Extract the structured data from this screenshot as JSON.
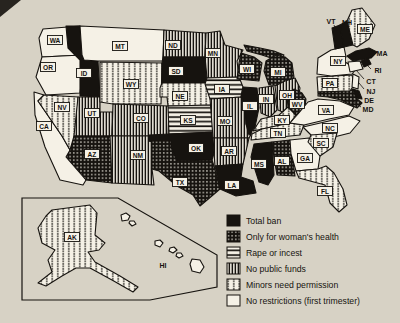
{
  "colors": {
    "page_bg": "#d7d2c5",
    "paper": "#f5f1e6",
    "ink": "#16130f"
  },
  "legend": {
    "items": [
      {
        "key": "ban",
        "label": "Total ban"
      },
      {
        "key": "health",
        "label": "Only for woman's health"
      },
      {
        "key": "rape",
        "label": "Rape or incest"
      },
      {
        "key": "funds",
        "label": "No public funds"
      },
      {
        "key": "minors",
        "label": "Minors need permission"
      },
      {
        "key": "none",
        "label": "No restrictions (first trimester)"
      }
    ]
  },
  "map": {
    "states": [
      {
        "abbr": "CA",
        "category": "none"
      },
      {
        "abbr": "WA",
        "category": "none"
      },
      {
        "abbr": "OR",
        "category": "none"
      },
      {
        "abbr": "NV",
        "category": "minors"
      },
      {
        "abbr": "ID",
        "category": "ban"
      },
      {
        "abbr": "UT",
        "category": "funds"
      },
      {
        "abbr": "AZ",
        "category": "health"
      },
      {
        "abbr": "MT",
        "category": "none"
      },
      {
        "abbr": "WY",
        "category": "minors"
      },
      {
        "abbr": "CO",
        "category": "funds"
      },
      {
        "abbr": "NM",
        "category": "funds"
      },
      {
        "abbr": "ND",
        "category": "funds"
      },
      {
        "abbr": "SD",
        "category": "ban"
      },
      {
        "abbr": "NE",
        "category": "minors"
      },
      {
        "abbr": "KS",
        "category": "rape"
      },
      {
        "abbr": "OK",
        "category": "ban"
      },
      {
        "abbr": "TX",
        "category": "health"
      },
      {
        "abbr": "MN",
        "category": "funds"
      },
      {
        "abbr": "IA",
        "category": "rape"
      },
      {
        "abbr": "MO",
        "category": "funds"
      },
      {
        "abbr": "AR",
        "category": "funds"
      },
      {
        "abbr": "LA",
        "category": "ban"
      },
      {
        "abbr": "WI",
        "category": "health"
      },
      {
        "abbr": "IL",
        "category": "ban"
      },
      {
        "abbr": "MS",
        "category": "ban"
      },
      {
        "abbr": "MI",
        "category": "health"
      },
      {
        "abbr": "IN",
        "category": "funds"
      },
      {
        "abbr": "OH",
        "category": "funds"
      },
      {
        "abbr": "KY",
        "category": "minors"
      },
      {
        "abbr": "TN",
        "category": "minors"
      },
      {
        "abbr": "AL",
        "category": "health"
      },
      {
        "abbr": "GA",
        "category": "none"
      },
      {
        "abbr": "FL",
        "category": "minors"
      },
      {
        "abbr": "WV",
        "category": "health"
      },
      {
        "abbr": "VA",
        "category": "none"
      },
      {
        "abbr": "NC",
        "category": "none"
      },
      {
        "abbr": "SC",
        "category": "minors"
      },
      {
        "abbr": "PA",
        "category": "minors"
      },
      {
        "abbr": "NY",
        "category": "none"
      },
      {
        "abbr": "VT",
        "category": "ban"
      },
      {
        "abbr": "NH",
        "category": "ban"
      },
      {
        "abbr": "ME",
        "category": "minors"
      },
      {
        "abbr": "MA",
        "category": "ban"
      },
      {
        "abbr": "RI",
        "category": "ban"
      },
      {
        "abbr": "CT",
        "category": "none"
      },
      {
        "abbr": "NJ",
        "category": "none"
      },
      {
        "abbr": "DE",
        "category": "ban"
      },
      {
        "abbr": "MD",
        "category": "health"
      },
      {
        "abbr": "AK",
        "category": "minors"
      },
      {
        "abbr": "HI",
        "category": "none"
      }
    ]
  }
}
